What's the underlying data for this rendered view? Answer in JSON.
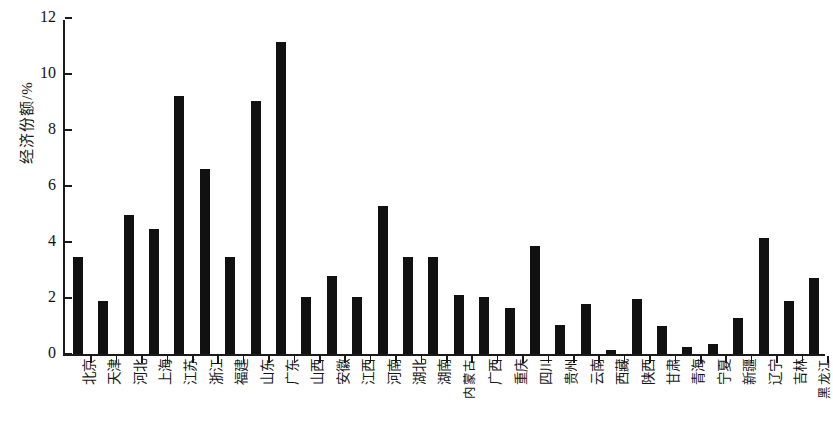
{
  "chart_data": {
    "type": "bar",
    "title": "",
    "subtitle": "",
    "xlabel": "",
    "ylabel": "经济份额/%",
    "ylim": [
      0,
      12
    ],
    "yticks": [
      0,
      2,
      4,
      6,
      8,
      10,
      12
    ],
    "ytick_labels": [
      "0",
      "2",
      "4",
      "6",
      "8",
      "10",
      "12"
    ],
    "grid": false,
    "legend": null,
    "bar_color": "#111111",
    "axis_color": "#1a1a1a",
    "categories": [
      "北京",
      "天津",
      "河北",
      "上海",
      "江苏",
      "浙江",
      "福建",
      "山东",
      "广东",
      "山西",
      "安徽",
      "江西",
      "河南",
      "湖北",
      "湖南",
      "内蒙古",
      "广西",
      "重庆",
      "四川",
      "贵州",
      "云南",
      "西藏",
      "陕西",
      "甘肃",
      "青海",
      "宁夏",
      "新疆",
      "辽宁",
      "吉林",
      "黑龙江"
    ],
    "values": [
      3.45,
      1.9,
      4.95,
      4.45,
      9.2,
      6.6,
      3.45,
      9.05,
      11.15,
      2.05,
      2.8,
      2.05,
      5.3,
      3.45,
      3.45,
      2.1,
      2.05,
      1.65,
      3.85,
      1.05,
      1.8,
      0.15,
      1.95,
      1.0,
      0.25,
      0.35,
      1.3,
      4.15,
      1.9,
      2.7
    ]
  }
}
